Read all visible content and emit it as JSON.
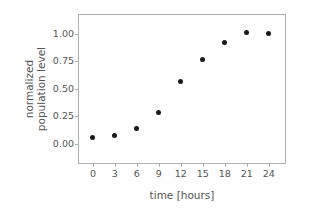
{
  "chart_data": {
    "type": "scatter",
    "title": "",
    "xlabel": "time [hours]",
    "ylabel_lines": [
      "normalized",
      "population level"
    ],
    "ylabel": "normalized population level",
    "x": [
      0,
      3,
      6,
      9,
      12,
      15,
      18,
      21,
      24
    ],
    "values": [
      0.06,
      0.08,
      0.14,
      0.29,
      0.57,
      0.77,
      0.92,
      1.01,
      1.0
    ],
    "series": [
      {
        "name": "normalized population level",
        "values": [
          0.06,
          0.08,
          0.14,
          0.29,
          0.57,
          0.77,
          0.92,
          1.01,
          1.0
        ]
      }
    ],
    "xticks": [
      0,
      3,
      6,
      9,
      12,
      15,
      18,
      21,
      24
    ],
    "xtick_labels": [
      "0",
      "3",
      "6",
      "9",
      "12",
      "15",
      "18",
      "21",
      "24"
    ],
    "yticks": [
      0.0,
      0.25,
      0.5,
      0.75,
      1.0
    ],
    "ytick_labels": [
      "0.00",
      "0.25",
      "0.50",
      "0.75",
      "1.00"
    ],
    "xlim": [
      -1.9,
      26.5
    ],
    "ylim": [
      -0.19,
      1.17
    ],
    "grid": false,
    "legend": null,
    "marker": "circle",
    "marker_color": "#1a1a1a",
    "spine_color": "#b0b0b0",
    "text_color": "#545454",
    "background_color": "#ffffff"
  }
}
